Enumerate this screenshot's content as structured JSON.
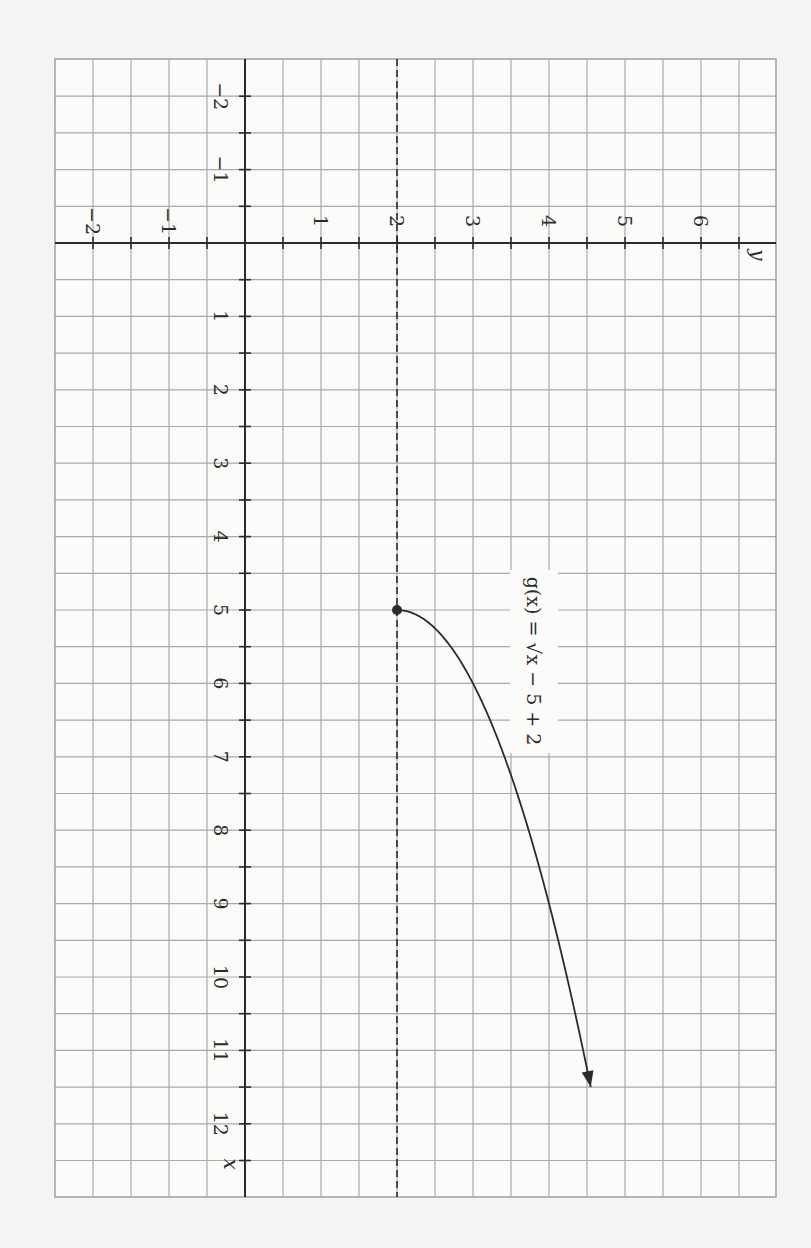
{
  "chart_data": {
    "type": "line",
    "title": "",
    "orientation_note": "figure printed rotated 90 degrees clockwise",
    "xlabel": "x",
    "ylabel": "y",
    "xlim": [
      -1.5,
      13
    ],
    "ylim": [
      -2.5,
      7
    ],
    "grid": true,
    "x_ticks": [
      -2,
      -1,
      1,
      2,
      3,
      4,
      5,
      6,
      7,
      8,
      9,
      10,
      11,
      12
    ],
    "x_tick_labels": [
      "−2",
      "−1",
      "1",
      "2",
      "3",
      "4",
      "5",
      "6",
      "7",
      "8",
      "9",
      "10",
      "11",
      "12"
    ],
    "y_ticks": [
      -2,
      -1,
      1,
      2,
      3,
      4,
      5,
      6
    ],
    "y_tick_labels": [
      "−2",
      "−1",
      "1",
      "2",
      "3",
      "4",
      "5",
      "6"
    ],
    "series": [
      {
        "name": "g(x) = √(x − 5) + 2",
        "function": "sqrt(x - 5) + 2",
        "x": [
          5,
          5.25,
          5.5,
          6,
          6.5,
          7,
          8,
          9,
          10,
          11,
          11.5
        ],
        "values": [
          2,
          2.5,
          2.71,
          3,
          3.22,
          3.41,
          3.73,
          4,
          4.24,
          4.45,
          4.55
        ],
        "start_point": {
          "x": 5,
          "y": 2,
          "marker": "filled-dot"
        },
        "end": "arrow"
      }
    ],
    "annotations": [
      {
        "type": "dashed-line",
        "orientation": "horizontal",
        "y": 2,
        "note": "horizontal asymptote-style reference at y = 2"
      },
      {
        "type": "label",
        "text": "g(x) = √(x − 5) + 2",
        "near": {
          "x": 6.2,
          "y": 4.1
        }
      }
    ]
  },
  "labels": {
    "x_axis": "x",
    "y_axis": "y",
    "function": "g(x) = √x − 5 + 2"
  }
}
